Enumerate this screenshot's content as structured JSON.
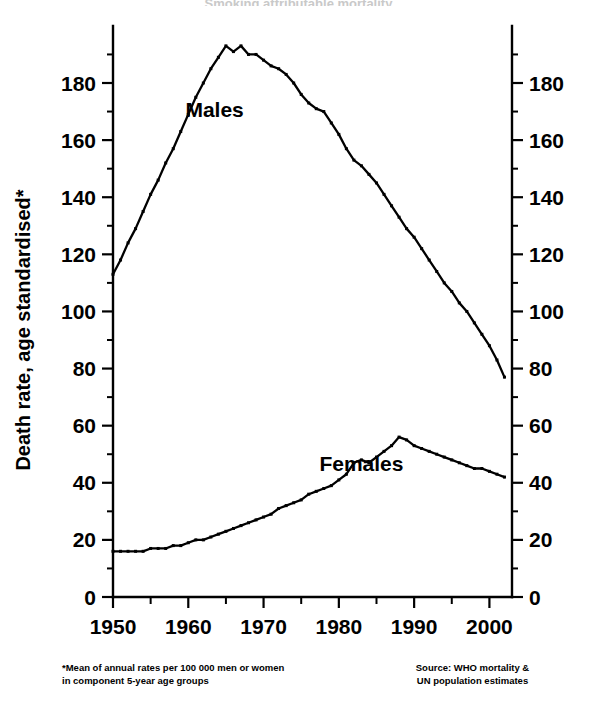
{
  "figure": {
    "clipped_title": "Smoking attributable mortality",
    "background_color": "#ffffff",
    "ink_color": "#000000"
  },
  "footnotes": {
    "left": "*Mean of annual rates per 100 000 men or women\nin component 5-year age groups",
    "right": "Source: WHO mortality &\nUN population estimates"
  },
  "chart_data": {
    "type": "line",
    "title": "",
    "xlabel": "",
    "ylabel": "Death rate, age standardised*",
    "xlim": [
      1950,
      2003
    ],
    "ylim": [
      0,
      195
    ],
    "grid": false,
    "legend_position": "inline-annotation",
    "x_ticks_major": [
      1950,
      1960,
      1970,
      1980,
      1990,
      2000
    ],
    "x_ticks_minor": [
      1955,
      1965,
      1975,
      1985,
      1995
    ],
    "y_ticks_major": [
      0,
      20,
      40,
      60,
      80,
      100,
      120,
      140,
      160,
      180
    ],
    "y_ticks_minor": [
      10,
      30,
      50,
      70,
      90,
      110,
      130,
      150,
      170,
      190
    ],
    "annotations": [
      {
        "text": "Males",
        "x": 1963.5,
        "y": 168
      },
      {
        "text": "Females",
        "x": 1983.0,
        "y": 44
      }
    ],
    "x": [
      1950,
      1951,
      1952,
      1953,
      1954,
      1955,
      1956,
      1957,
      1958,
      1959,
      1960,
      1961,
      1962,
      1963,
      1964,
      1965,
      1966,
      1967,
      1968,
      1969,
      1970,
      1971,
      1972,
      1973,
      1974,
      1975,
      1976,
      1977,
      1978,
      1979,
      1980,
      1981,
      1982,
      1983,
      1984,
      1985,
      1986,
      1987,
      1988,
      1989,
      1990,
      1991,
      1992,
      1993,
      1994,
      1995,
      1996,
      1997,
      1998,
      1999,
      2000,
      2001,
      2002
    ],
    "series": [
      {
        "name": "Males",
        "values": [
          113,
          118,
          124,
          129,
          135,
          141,
          146,
          152,
          157,
          163,
          169,
          175,
          180,
          185,
          189,
          193,
          191,
          193,
          190,
          190,
          188,
          186,
          185,
          183,
          180,
          176,
          173,
          171,
          170,
          166,
          162,
          157,
          153,
          151,
          148,
          145,
          141,
          137,
          133,
          129,
          126,
          122,
          118,
          114,
          110,
          107,
          103,
          100,
          96,
          92,
          88,
          83,
          77
        ]
      },
      {
        "name": "Females",
        "values": [
          16,
          16,
          16,
          16,
          16,
          17,
          17,
          17,
          18,
          18,
          19,
          20,
          20,
          21,
          22,
          23,
          24,
          25,
          26,
          27,
          28,
          29,
          31,
          32,
          33,
          34,
          36,
          37,
          38,
          39,
          41,
          43,
          47,
          48,
          47,
          49,
          51,
          53,
          56,
          55,
          53,
          52,
          51,
          50,
          49,
          48,
          47,
          46,
          45,
          45,
          44,
          43,
          42
        ]
      }
    ]
  }
}
